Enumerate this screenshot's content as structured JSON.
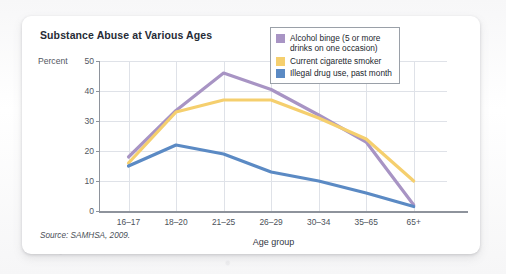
{
  "card": {
    "title": "Substance Abuse at Various Ages",
    "source": "Source: SAMHSA, 2009."
  },
  "chart_data": {
    "type": "line",
    "title": "Substance Abuse at Various Ages",
    "xlabel": "Age group",
    "ylabel": "Percent",
    "ylim": [
      0,
      50
    ],
    "yticks": [
      0,
      10,
      20,
      30,
      40,
      50
    ],
    "grid": true,
    "legend_position": "top-right",
    "categories": [
      "16–17",
      "18–20",
      "21–25",
      "26–29",
      "30–34",
      "35–65",
      "65+"
    ],
    "series": [
      {
        "name": "Alcohol binge (5 or more\ndrinks on one occasion)",
        "color": "#a894c4",
        "values": [
          18,
          33.5,
          46,
          40.5,
          32,
          23,
          2
        ]
      },
      {
        "name": "Current cigarette smoker",
        "color": "#f5cf6e",
        "values": [
          16,
          33,
          37,
          37,
          31,
          24,
          10
        ]
      },
      {
        "name": "Illegal drug use, past month",
        "color": "#5b8ac4",
        "values": [
          15,
          22,
          19,
          13,
          10,
          6,
          1.5
        ]
      }
    ],
    "annotations": [
      "Source: SAMHSA, 2009."
    ]
  }
}
